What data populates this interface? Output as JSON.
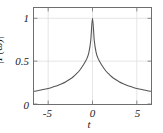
{
  "chart_data": {
    "type": "line",
    "title": "",
    "xlabel": "t",
    "ylabel": "|F(ω)|",
    "xlim": [
      -6.6,
      6.6
    ],
    "ylim": [
      0,
      1.12
    ],
    "grid": true,
    "legend": null,
    "xticks": [
      -5,
      0,
      5
    ],
    "xtick_labels": [
      "-5",
      "0",
      "5"
    ],
    "yticks": [
      0,
      0.5,
      1
    ],
    "ytick_labels": [
      "0",
      "0.5",
      "1"
    ],
    "line_color": "#555555",
    "grid_color": "#dedede",
    "frame_color": "#6e6e6e",
    "series": [
      {
        "name": "|F(ω)|",
        "x": [
          -6.6,
          -6.2,
          -5.8,
          -5.4,
          -5.0,
          -4.6,
          -4.2,
          -3.8,
          -3.4,
          -3.0,
          -2.6,
          -2.2,
          -1.8,
          -1.4,
          -1.0,
          -0.8,
          -0.6,
          -0.4,
          -0.2,
          0.0,
          0.2,
          0.4,
          0.6,
          0.8,
          1.0,
          1.4,
          1.8,
          2.2,
          2.6,
          3.0,
          3.4,
          3.8,
          4.2,
          4.6,
          5.0,
          5.4,
          5.8,
          6.2,
          6.6
        ],
        "y": [
          0.148,
          0.155,
          0.163,
          0.172,
          0.182,
          0.193,
          0.206,
          0.221,
          0.239,
          0.26,
          0.285,
          0.315,
          0.353,
          0.4,
          0.46,
          0.497,
          0.538,
          0.605,
          0.74,
          1.0,
          0.74,
          0.605,
          0.538,
          0.497,
          0.46,
          0.4,
          0.353,
          0.315,
          0.285,
          0.26,
          0.239,
          0.221,
          0.206,
          0.193,
          0.182,
          0.172,
          0.163,
          0.155,
          0.148
        ]
      }
    ]
  },
  "axes": {
    "ylabel_text": "|F(ω)|",
    "xlabel_text": "t"
  }
}
